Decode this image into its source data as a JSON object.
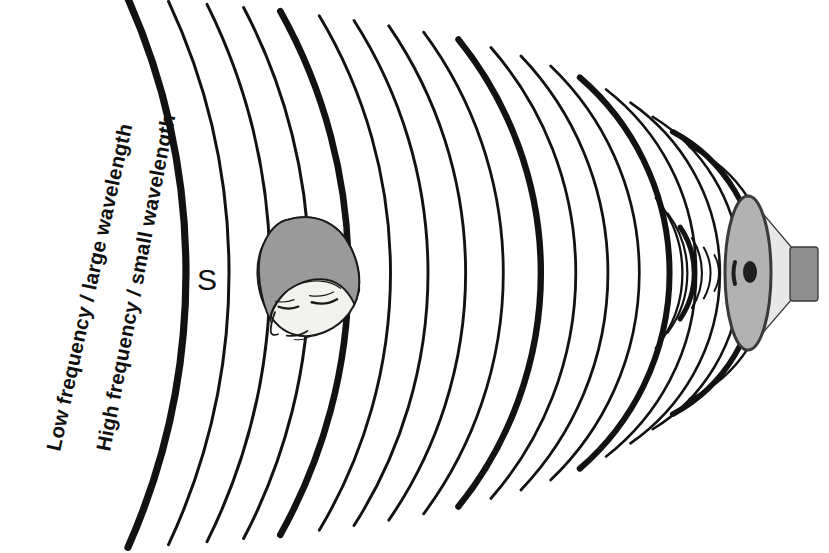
{
  "figure": {
    "name": "sound-wave-propagation-diagram",
    "background_color": "#ffffff",
    "width": 829,
    "height": 553,
    "ink_color": "#121212"
  },
  "labels": {
    "low_frequency": "Low frequency / large wavelength",
    "high_frequency": "High frequency / small wavelength",
    "source_letter": "S"
  },
  "source": {
    "name": "loudspeaker-horn",
    "face_color": "#b2b2b2",
    "cone_color": "#e8e8e8",
    "magnet_color": "#8f8f8f",
    "outline_color": "#3a3a3a",
    "center_x": 748,
    "center_y": 273,
    "face_rx": 23,
    "face_ry": 77
  },
  "listener": {
    "name": "human-head-listener",
    "hair_color": "#9a9a9a",
    "skin_color": "#f2f2ee",
    "outline_color": "#1a1a1a",
    "center_x": 305,
    "center_y": 275
  },
  "chart_data": {
    "type": "line",
    "xlabel": "",
    "ylabel": "",
    "origin_x": 748,
    "origin_y": 273,
    "legend": [
      "Low frequency / large wavelength",
      "High frequency / small wavelength"
    ],
    "annotations": [
      {
        "text": "S",
        "x": 205,
        "y": 277,
        "meaning": "sound source direction marker"
      },
      {
        "text": "Low frequency / large wavelength",
        "x": 63,
        "y": 300,
        "rotated": true
      },
      {
        "text": "High frequency / small wavelength",
        "x": 112,
        "y": 300,
        "rotated": true
      }
    ],
    "series": [
      {
        "name": "wavefront-arcs",
        "unit": "radius-px",
        "values": [
          {
            "radius": 678,
            "weight": "thick",
            "stroke": 7.2
          },
          {
            "radius": 640,
            "weight": "thin",
            "stroke": 3.0
          },
          {
            "radius": 604,
            "weight": "thin",
            "stroke": 3.0
          },
          {
            "radius": 570,
            "weight": "thin",
            "stroke": 3.0
          },
          {
            "radius": 536,
            "weight": "thick",
            "stroke": 6.6
          },
          {
            "radius": 500,
            "weight": "thin",
            "stroke": 2.9
          },
          {
            "radius": 468,
            "weight": "thin",
            "stroke": 2.9
          },
          {
            "radius": 436,
            "weight": "thin",
            "stroke": 2.9
          },
          {
            "radius": 404,
            "weight": "thin",
            "stroke": 2.8
          },
          {
            "radius": 372,
            "weight": "thick",
            "stroke": 6.4
          },
          {
            "radius": 342,
            "weight": "thin",
            "stroke": 2.8
          },
          {
            "radius": 314,
            "weight": "thin",
            "stroke": 2.8
          },
          {
            "radius": 286,
            "weight": "thin",
            "stroke": 2.7
          },
          {
            "radius": 258,
            "weight": "thick",
            "stroke": 6.0
          },
          {
            "radius": 232,
            "weight": "thin",
            "stroke": 2.6
          },
          {
            "radius": 207,
            "weight": "thin",
            "stroke": 2.6
          },
          {
            "radius": 183,
            "weight": "thin",
            "stroke": 2.5
          },
          {
            "radius": 160,
            "weight": "thick",
            "stroke": 5.6
          },
          {
            "radius": 139,
            "weight": "thin",
            "stroke": 2.4
          },
          {
            "radius": 119,
            "weight": "thin",
            "stroke": 2.3
          },
          {
            "radius": 100,
            "weight": "thin",
            "stroke": 2.2
          },
          {
            "radius": 82,
            "weight": "thick",
            "stroke": 5.0
          },
          {
            "radius": 66,
            "weight": "thin",
            "stroke": 2.1
          },
          {
            "radius": 51,
            "weight": "thin",
            "stroke": 2.0
          },
          {
            "radius": 38,
            "weight": "thin",
            "stroke": 1.9
          }
        ]
      }
    ]
  }
}
